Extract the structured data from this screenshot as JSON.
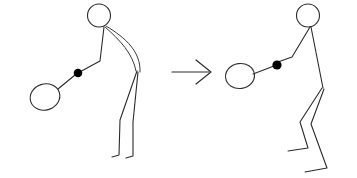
{
  "figure": {
    "background_color": "#ffffff",
    "line_color": "#2b2b2b",
    "ball_color": "#000000",
    "width": 357,
    "height": 178
  },
  "panels": [
    {
      "name": "left-pose",
      "description": "Stick figure bent forward at the waist, arm extended down-left holding an oval racket with a ball near the hand",
      "head": {
        "cx": 99,
        "cy": 15.5,
        "rx": 11.5,
        "ry": 11.5
      },
      "neck": {
        "x": 104,
        "y": 27
      },
      "arm": "M 104 27 L 100 61 L 76 74",
      "ball": {
        "cx": 78,
        "cy": 73,
        "r": 4.3
      },
      "racket_handle": "M 75 75 L 58 89",
      "racket": {
        "cx": 45,
        "cy": 97,
        "rx": 15,
        "ry": 13,
        "rotate": -18
      },
      "back_curve_outer": "M 106 26 C 126 38 141 52 140 72",
      "back_curve_inner": "M 105 27 C 120 40 133 54 136 71",
      "hip": {
        "x": 137,
        "y": 71
      },
      "leg_front": "M 137 71 L 120 120 L 119 155 L 112 157",
      "leg_back": "M 138 72 L 133 122 L 133 156 L 126 158"
    },
    {
      "name": "right-pose",
      "description": "Stick figure standing more upright with bent knees, arm extended down-left holding the oval racket with the ball near the hand",
      "head": {
        "cx": 308,
        "cy": 15.5,
        "rx": 11.5,
        "ry": 11.5
      },
      "neck": {
        "x": 310,
        "y": 27
      },
      "arm": "M 310 27 L 292 57 L 275 63",
      "ball": {
        "cx": 277,
        "cy": 65,
        "r": 4.6
      },
      "racket_handle": "M 274 66 L 253 74",
      "racket": {
        "cx": 240,
        "cy": 76,
        "rx": 14.5,
        "ry": 12.5,
        "rotate": -8
      },
      "torso": "M 311 27 L 323 88",
      "hip": {
        "x": 323,
        "y": 88
      },
      "leg_front": "M 322 88 L 300 122 L 308 148 L 288 151",
      "leg_back": "M 324 89 L 311 124 L 327 168 L 305 172"
    }
  ],
  "arrow": {
    "name": "transition-arrow",
    "label": "",
    "shaft": "M 172 72 L 209 72",
    "head": "M 196 60 L 211 72 L 196 84",
    "direction": "right"
  }
}
